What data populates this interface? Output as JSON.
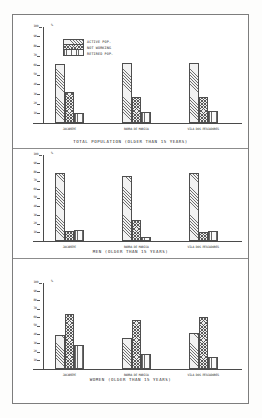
{
  "legend": {
    "items": [
      {
        "label": "ACTIVE POP.",
        "pattern": "diagonal-hatch"
      },
      {
        "label": "NOT WORKING",
        "pattern": "cross-hatch"
      },
      {
        "label": "RETIRED POP.",
        "pattern": "vertical-hatch"
      }
    ]
  },
  "axis": {
    "unit": "%",
    "ticks": [
      "100",
      "90",
      "80",
      "70",
      "60",
      "50",
      "40",
      "30",
      "20",
      "10"
    ]
  },
  "chart_data": [
    {
      "type": "bar",
      "title": "TOTAL POPULATION (OLDER THAN 15 YEARS)",
      "categories": [
        "JACAREPE",
        "BARRA DE MARICA",
        "VILA DOS PESCADORES"
      ],
      "series": [
        {
          "name": "ACTIVE POP.",
          "values": [
            61,
            63,
            63
          ]
        },
        {
          "name": "NOT WORKING",
          "values": [
            32,
            27,
            27
          ]
        },
        {
          "name": "RETIRED POP.",
          "values": [
            10,
            11,
            12
          ]
        }
      ],
      "xlabel": "",
      "ylabel": "%",
      "ylim": [
        0,
        100
      ],
      "grid": false,
      "legend_position": "top-center"
    },
    {
      "type": "bar",
      "title": "MEN (OLDER THAN 15 YEARS)",
      "categories": [
        "JACAREPE",
        "BARRA DE MARICA",
        "VILA DOS PESCADORES"
      ],
      "series": [
        {
          "name": "ACTIVE POP.",
          "values": [
            79,
            76,
            79
          ]
        },
        {
          "name": "NOT WORKING",
          "values": [
            12,
            25,
            11
          ]
        },
        {
          "name": "RETIRED POP.",
          "values": [
            13,
            5,
            12
          ]
        }
      ],
      "xlabel": "",
      "ylabel": "%",
      "ylim": [
        0,
        100
      ],
      "grid": false,
      "legend_position": "none"
    },
    {
      "type": "bar",
      "title": "WOMEN (OLDER THAN 15 YEARS)",
      "categories": [
        "JACAREPE",
        "BARRA DE MARICA",
        "VILA DOS PESCADORES"
      ],
      "series": [
        {
          "name": "ACTIVE POP.",
          "values": [
            39,
            36,
            42
          ]
        },
        {
          "name": "NOT WORKING",
          "values": [
            64,
            57,
            61
          ]
        },
        {
          "name": "RETIRED POP.",
          "values": [
            28,
            18,
            14
          ]
        }
      ],
      "xlabel": "",
      "ylabel": "%",
      "ylim": [
        0,
        100
      ],
      "grid": false,
      "legend_position": "none"
    }
  ]
}
